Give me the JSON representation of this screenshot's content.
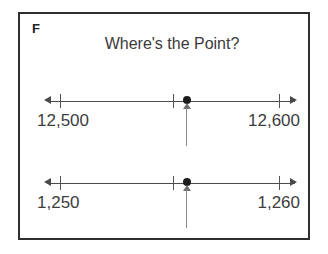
{
  "card": {
    "problem_letter": "F",
    "title": "Where's the Point?",
    "border_color": "#2f2f2f",
    "background_color": "#ffffff"
  },
  "style": {
    "line_color": "#4a4a4a",
    "point_color": "#1d1d1d",
    "pointer_color": "#8a8a8a",
    "text_color": "#3d3d3d"
  },
  "number_lines": [
    {
      "id": "numberline-1",
      "left_label": "12,500",
      "right_label": "12,600",
      "left_arrow_icon": "arrow-left-icon",
      "right_arrow_icon": "arrow-right-icon",
      "pointer_icon": "arrow-up-icon",
      "point_icon": "point-dot-icon"
    },
    {
      "id": "numberline-2",
      "left_label": "1,250",
      "right_label": "1,260",
      "left_arrow_icon": "arrow-left-icon",
      "right_arrow_icon": "arrow-right-icon",
      "pointer_icon": "arrow-up-icon",
      "point_icon": "point-dot-icon"
    }
  ]
}
